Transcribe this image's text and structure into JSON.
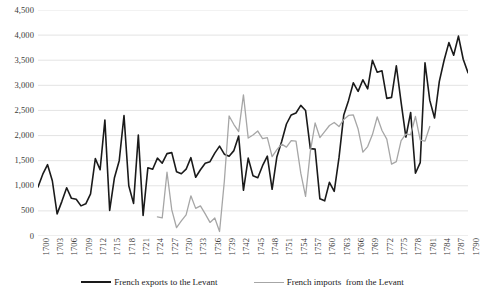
{
  "chart_data": {
    "type": "line",
    "title": "",
    "subtitle": "",
    "xlabel": "",
    "ylabel": "",
    "ylim": [
      0,
      4500
    ],
    "ytick_step": 500,
    "ytick_labels": [
      "4,500",
      "4,000",
      "3,500",
      "3,000",
      "2,500",
      "2,000",
      "1,500",
      "1,000",
      "500",
      "0"
    ],
    "ytick_values": [
      4500,
      4000,
      3500,
      3000,
      2500,
      2000,
      1500,
      1000,
      500,
      0
    ],
    "xlim": [
      1700,
      1790
    ],
    "xtick_labels": [
      "1700",
      "1703",
      "1706",
      "1709",
      "1712",
      "1715",
      "1718",
      "1721",
      "1724",
      "1727",
      "1730",
      "1733",
      "1736",
      "1739",
      "1742",
      "1745",
      "1748",
      "1751",
      "1754",
      "1757",
      "1760",
      "1763",
      "1766",
      "1769",
      "1772",
      "1775",
      "1778",
      "1781",
      "1784",
      "1787",
      "1790"
    ],
    "xtick_values": [
      1700,
      1703,
      1706,
      1709,
      1712,
      1715,
      1718,
      1721,
      1724,
      1727,
      1730,
      1733,
      1736,
      1739,
      1742,
      1745,
      1748,
      1751,
      1754,
      1757,
      1760,
      1763,
      1766,
      1769,
      1772,
      1775,
      1778,
      1781,
      1784,
      1787,
      1790
    ],
    "grid": {
      "horizontal": true,
      "vertical": false,
      "color": "#d9d9d9"
    },
    "legend_position": "bottom",
    "series": [
      {
        "name": "French exports to the Levant",
        "color": "#1a1a1a",
        "x_start": 1700,
        "values": [
          975,
          1230,
          1420,
          1100,
          440,
          690,
          960,
          750,
          730,
          600,
          640,
          840,
          1540,
          1320,
          2310,
          510,
          1160,
          1500,
          2400,
          1000,
          650,
          2010,
          410,
          1360,
          1330,
          1550,
          1450,
          1640,
          1660,
          1280,
          1240,
          1330,
          1560,
          1170,
          1320,
          1450,
          1480,
          1650,
          1790,
          1630,
          1590,
          1700,
          1990,
          910,
          1550,
          1200,
          1160,
          1400,
          1590,
          930,
          1580,
          1880,
          2230,
          2410,
          2450,
          2600,
          2500,
          1740,
          1730,
          740,
          700,
          1070,
          890,
          1560,
          2410,
          2700,
          3050,
          2880,
          3110,
          2930,
          3500,
          3260,
          3290,
          2740,
          2760,
          3390,
          2660,
          1970,
          2460,
          1250,
          1460,
          3450,
          2700,
          2350,
          3080,
          3500,
          3850,
          3600,
          3980,
          3520,
          3250
        ]
      },
      {
        "name": "French imports  from the Levant",
        "color": "#a6a6a6",
        "x_start": 1725,
        "values": [
          380,
          360,
          1270,
          520,
          165,
          300,
          420,
          800,
          550,
          600,
          440,
          270,
          360,
          90,
          1090,
          2390,
          2220,
          2080,
          2810,
          1950,
          2010,
          2090,
          1940,
          1960,
          1580,
          1720,
          1830,
          1770,
          1900,
          1890,
          1250,
          790,
          1680,
          2250,
          1960,
          2080,
          2200,
          2260,
          2180,
          2320,
          2400,
          2410,
          2130,
          1670,
          1780,
          2020,
          2370,
          2100,
          1930,
          1430,
          1480,
          1900,
          2030,
          2020,
          2380,
          1910,
          1890,
          2180
        ]
      }
    ]
  },
  "legend": {
    "items": [
      {
        "label": "French exports to the Levant",
        "color": "#1a1a1a"
      },
      {
        "label": "French imports  from the Levant",
        "color": "#a6a6a6"
      }
    ]
  }
}
